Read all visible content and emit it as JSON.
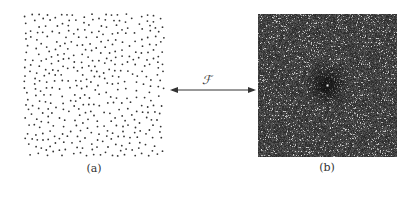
{
  "figure": {
    "panels": [
      {
        "id": "a",
        "label": "(a)",
        "description": "random point pattern (white background, black dots)"
      },
      {
        "id": "b",
        "label": "(b)",
        "description": "Fourier spectrum (noisy dark image with darker central region and bright center point)"
      }
    ],
    "transform": {
      "label": "ℱ",
      "arrow": "double-headed"
    }
  },
  "colors": {
    "dot": "#333333",
    "spectrum_bg": "#2e2e2e",
    "arrow": "#333333"
  }
}
